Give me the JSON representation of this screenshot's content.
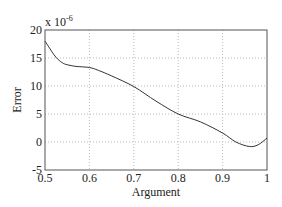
{
  "chart_data": {
    "type": "line",
    "title": "",
    "xlabel": "Argument",
    "ylabel": "Error",
    "y_multiplier": "x 10",
    "y_exponent": "-6",
    "xlim": [
      0.5,
      1.0
    ],
    "ylim": [
      -5,
      20
    ],
    "grid": true,
    "x_ticks": [
      "0.5",
      "0.6",
      "0.7",
      "0.8",
      "0.9",
      "1"
    ],
    "y_ticks": [
      "-5",
      "0",
      "5",
      "10",
      "15",
      "20"
    ],
    "series": [
      {
        "name": "Error",
        "x": [
          0.5,
          0.51,
          0.52,
          0.53,
          0.54,
          0.55,
          0.57,
          0.6,
          0.62,
          0.65,
          0.7,
          0.75,
          0.8,
          0.85,
          0.9,
          0.93,
          0.96,
          0.98,
          1.0
        ],
        "values": [
          18.0,
          16.8,
          15.6,
          14.7,
          14.1,
          13.8,
          13.5,
          13.3,
          12.8,
          11.8,
          9.9,
          7.3,
          5.0,
          3.6,
          1.6,
          0.0,
          -0.8,
          -0.5,
          0.7
        ]
      }
    ]
  }
}
